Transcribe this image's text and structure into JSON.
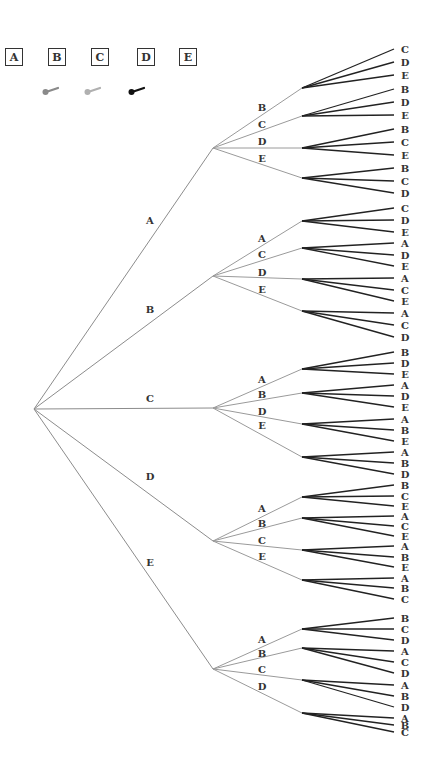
{
  "legend": {
    "boxes": [
      {
        "label": "A",
        "x": 5
      },
      {
        "label": "B",
        "x": 48
      },
      {
        "label": "C",
        "x": 91
      },
      {
        "label": "D",
        "x": 137
      },
      {
        "label": "E",
        "x": 179
      }
    ],
    "pins": [
      {
        "name": "gray-pin-icon",
        "x": 42,
        "color": "#8a8a8a"
      },
      {
        "name": "light-gray-pin-icon",
        "x": 84,
        "color": "#b0b0b0"
      },
      {
        "name": "black-pin-icon",
        "x": 128,
        "color": "#111111"
      }
    ]
  },
  "tree": {
    "root": {
      "x": 34,
      "y": 409
    },
    "level1_x": 213,
    "level2_x": 302,
    "leaf_end_x": 394,
    "leaf_label_x": 402,
    "level1_label_x": 150,
    "level2_label_x": 262,
    "branches": [
      {
        "label": "A",
        "y": 148,
        "label_y": 220,
        "children": [
          {
            "label": "B",
            "y": 88,
            "label_y": 107,
            "leaves": [
              {
                "label": "C",
                "y": 49
              },
              {
                "label": "D",
                "y": 62
              },
              {
                "label": "E",
                "y": 75
              }
            ]
          },
          {
            "label": "C",
            "y": 116,
            "label_y": 124,
            "leaves": [
              {
                "label": "B",
                "y": 89
              },
              {
                "label": "D",
                "y": 102
              },
              {
                "label": "E",
                "y": 115
              }
            ]
          },
          {
            "label": "D",
            "y": 148,
            "label_y": 141,
            "leaves": [
              {
                "label": "B",
                "y": 129
              },
              {
                "label": "C",
                "y": 142
              },
              {
                "label": "E",
                "y": 155
              }
            ]
          },
          {
            "label": "E",
            "y": 178,
            "label_y": 158,
            "leaves": [
              {
                "label": "B",
                "y": 168
              },
              {
                "label": "C",
                "y": 181
              },
              {
                "label": "D",
                "y": 193
              }
            ]
          }
        ]
      },
      {
        "label": "B",
        "y": 276,
        "label_y": 309,
        "children": [
          {
            "label": "A",
            "y": 221,
            "label_y": 238,
            "leaves": [
              {
                "label": "C",
                "y": 208
              },
              {
                "label": "D",
                "y": 220
              },
              {
                "label": "E",
                "y": 232
              }
            ]
          },
          {
            "label": "C",
            "y": 248,
            "label_y": 254,
            "leaves": [
              {
                "label": "A",
                "y": 243
              },
              {
                "label": "D",
                "y": 255
              },
              {
                "label": "E",
                "y": 266
              }
            ]
          },
          {
            "label": "D",
            "y": 279,
            "label_y": 272,
            "leaves": [
              {
                "label": "A",
                "y": 278
              },
              {
                "label": "C",
                "y": 290
              },
              {
                "label": "E",
                "y": 301
              }
            ]
          },
          {
            "label": "E",
            "y": 311,
            "label_y": 289,
            "leaves": [
              {
                "label": "A",
                "y": 313
              },
              {
                "label": "C",
                "y": 325
              },
              {
                "label": "D",
                "y": 337
              }
            ]
          }
        ]
      },
      {
        "label": "C",
        "y": 408,
        "label_y": 398,
        "children": [
          {
            "label": "A",
            "y": 369,
            "label_y": 379,
            "leaves": [
              {
                "label": "B",
                "y": 352
              },
              {
                "label": "D",
                "y": 363
              },
              {
                "label": "E",
                "y": 374
              }
            ]
          },
          {
            "label": "B",
            "y": 393,
            "label_y": 394,
            "leaves": [
              {
                "label": "A",
                "y": 385
              },
              {
                "label": "D",
                "y": 396
              },
              {
                "label": "E",
                "y": 407
              }
            ]
          },
          {
            "label": "D",
            "y": 424,
            "label_y": 411,
            "leaves": [
              {
                "label": "A",
                "y": 419
              },
              {
                "label": "B",
                "y": 430
              },
              {
                "label": "E",
                "y": 441
              }
            ]
          },
          {
            "label": "E",
            "y": 457,
            "label_y": 425,
            "leaves": [
              {
                "label": "A",
                "y": 452
              },
              {
                "label": "B",
                "y": 463
              },
              {
                "label": "D",
                "y": 474
              }
            ]
          }
        ]
      },
      {
        "label": "D",
        "y": 541,
        "label_y": 476,
        "children": [
          {
            "label": "A",
            "y": 497,
            "label_y": 508,
            "leaves": [
              {
                "label": "B",
                "y": 485
              },
              {
                "label": "C",
                "y": 496
              },
              {
                "label": "E",
                "y": 506
              }
            ]
          },
          {
            "label": "B",
            "y": 518,
            "label_y": 523,
            "leaves": [
              {
                "label": "A",
                "y": 516
              },
              {
                "label": "C",
                "y": 526
              },
              {
                "label": "E",
                "y": 536
              }
            ]
          },
          {
            "label": "C",
            "y": 550,
            "label_y": 540,
            "leaves": [
              {
                "label": "A",
                "y": 546
              },
              {
                "label": "B",
                "y": 557
              },
              {
                "label": "E",
                "y": 567
              }
            ]
          },
          {
            "label": "E",
            "y": 580,
            "label_y": 556,
            "leaves": [
              {
                "label": "A",
                "y": 578
              },
              {
                "label": "B",
                "y": 588
              },
              {
                "label": "C",
                "y": 599
              }
            ]
          }
        ]
      },
      {
        "label": "E",
        "y": 669,
        "label_y": 562,
        "children": [
          {
            "label": "A",
            "y": 629,
            "label_y": 639,
            "leaves": [
              {
                "label": "B",
                "y": 618
              },
              {
                "label": "C",
                "y": 629
              },
              {
                "label": "D",
                "y": 640
              }
            ]
          },
          {
            "label": "B",
            "y": 648,
            "label_y": 653,
            "leaves": [
              {
                "label": "A",
                "y": 651
              },
              {
                "label": "C",
                "y": 662
              },
              {
                "label": "D",
                "y": 673
              }
            ]
          },
          {
            "label": "C",
            "y": 680,
            "label_y": 669,
            "leaves": [
              {
                "label": "A",
                "y": 685
              },
              {
                "label": "B",
                "y": 696
              },
              {
                "label": "D",
                "y": 707
              }
            ]
          },
          {
            "label": "D",
            "y": 713,
            "label_y": 686,
            "leaves": [
              {
                "label": "A",
                "y": 718
              },
              {
                "label": "B",
                "y": 725
              },
              {
                "label": "C",
                "y": 732
              }
            ]
          }
        ]
      }
    ]
  },
  "colors": {
    "level1_edge": "#8c8c8c",
    "level2_edge": "#9a9a9a",
    "leaf_edge": "#222222",
    "text": "#333333"
  }
}
